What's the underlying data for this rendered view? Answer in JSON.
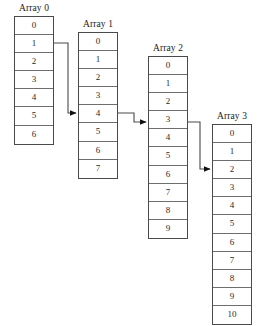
{
  "diagram": {
    "width": 270,
    "height": 326,
    "background_color": "#ffffff",
    "line_color": "#4a4a4a",
    "text_color": "#1a1a1a"
  },
  "arrays": [
    {
      "label": "Array 0",
      "cells": [
        "0",
        "1",
        "2",
        "3",
        "4",
        "5",
        "6"
      ],
      "cell_count": 7,
      "x": 14,
      "y": 16,
      "source_index": 1
    },
    {
      "label": "Array 1",
      "cells": [
        "0",
        "1",
        "2",
        "3",
        "4",
        "5",
        "6",
        "7"
      ],
      "cell_count": 8,
      "x": 78,
      "y": 32,
      "target_index": 4,
      "source_index": 4
    },
    {
      "label": "Array 2",
      "cells": [
        "0",
        "1",
        "2",
        "3",
        "4",
        "5",
        "6",
        "7",
        "8",
        "9"
      ],
      "cell_count": 10,
      "x": 148,
      "y": 56,
      "target_index": 3,
      "source_index": 3
    },
    {
      "label": "Array 3",
      "cells": [
        "0",
        "1",
        "2",
        "3",
        "4",
        "5",
        "6",
        "7",
        "8",
        "9",
        "10"
      ],
      "cell_count": 11,
      "x": 212,
      "y": 124,
      "target_index": 2
    }
  ],
  "connectors": [
    {
      "name": "array0-to-array1",
      "from_array": "Array 0",
      "from_cell": "1",
      "to_array": "Array 1",
      "to_cell": "4",
      "path": "M 54 43 L 68 43 L 68 113 L 76 113"
    },
    {
      "name": "array1-to-array2",
      "from_array": "Array 1",
      "from_cell": "4",
      "to_array": "Array 2",
      "to_cell": "3",
      "path": "M 118 113 L 134 113 L 134 122 L 146 122"
    },
    {
      "name": "array2-to-array3",
      "from_array": "Array 2",
      "from_cell": "3",
      "to_array": "Array 3",
      "to_cell": "2",
      "path": "M 188 122 L 200 122 L 200 169 L 210 169"
    }
  ]
}
